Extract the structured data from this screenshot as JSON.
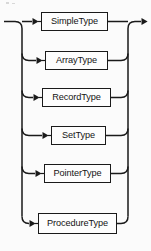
{
  "diagram": {
    "type": "railroad-syntax-diagram",
    "title": "Type",
    "entry_arrow": "arrow-right",
    "exit_arrow": "arrow-right",
    "alternatives": [
      {
        "label": "SimpleType",
        "box": {
          "x": 41,
          "y": 12,
          "w": 67,
          "h": 19
        },
        "arrow_x": 33,
        "branch_y": 21.5,
        "is_main_line": true
      },
      {
        "label": "ArrayType",
        "box": {
          "x": 45,
          "y": 51,
          "w": 63,
          "h": 19
        },
        "arrow_x": 37,
        "branch_y": 60.5,
        "is_main_line": false
      },
      {
        "label": "RecordType",
        "box": {
          "x": 42,
          "y": 88,
          "w": 69,
          "h": 19
        },
        "arrow_x": 34,
        "branch_y": 97.5,
        "is_main_line": false
      },
      {
        "label": "SetType",
        "box": {
          "x": 51,
          "y": 126,
          "w": 55,
          "h": 19
        },
        "arrow_x": 43,
        "branch_y": 135.5,
        "is_main_line": false
      },
      {
        "label": "PointerType",
        "box": {
          "x": 44,
          "y": 164,
          "w": 67,
          "h": 19
        },
        "arrow_x": 36,
        "branch_y": 173.5,
        "is_main_line": false
      },
      {
        "label": "ProcedureType",
        "box": {
          "x": 38,
          "y": 213,
          "w": 79,
          "h": 21
        },
        "arrow_x": 30,
        "branch_y": 223.5,
        "is_main_line": false
      }
    ],
    "rails": {
      "left_rail_x": 22,
      "right_rail_x": 128,
      "main_y": 21.5,
      "entry_start_x": 4,
      "exit_end_x": 147,
      "corner_radius": 7
    },
    "colors": {
      "line": "#1a1a1a",
      "box_border": "#1a1a1a",
      "box_fill": "#fdfdfd",
      "text": "#141414",
      "background": "#fbfbfb"
    }
  }
}
